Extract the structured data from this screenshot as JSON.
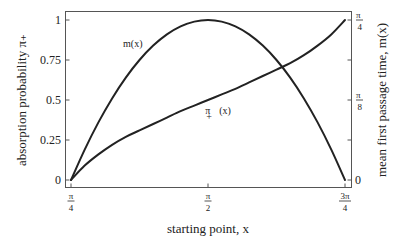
{
  "chart_data": {
    "type": "line",
    "title": "",
    "xlabel": "starting point, x",
    "ylabel": "absorption probability π₊",
    "y2label": "mean first passage time, m(x)",
    "xlim": [
      "π/4",
      "3π/4"
    ],
    "ylim": [
      0,
      1
    ],
    "y2lim": [
      "0",
      "π/4"
    ],
    "grid": false,
    "legend": "none (inline annotations)",
    "x_ticks": [
      {
        "num": "π",
        "den": "4",
        "frac": 0.0
      },
      {
        "num": "π",
        "den": "2",
        "frac": 0.5
      },
      {
        "num": "3π",
        "den": "4",
        "frac": 1.0
      }
    ],
    "y_ticks": [
      {
        "label": "0",
        "value": 0
      },
      {
        "label": "0.25",
        "value": 0.25
      },
      {
        "label": "0.5",
        "value": 0.5
      },
      {
        "label": "0.75",
        "value": 0.75
      },
      {
        "label": "1",
        "value": 1
      }
    ],
    "y2_ticks": [
      {
        "label": "0",
        "num": "",
        "den": "",
        "value": 0
      },
      {
        "label": "",
        "num": "",
        "den": "",
        "value": 0.25
      },
      {
        "label": "",
        "num": "π",
        "den": "8",
        "value": 0.5
      },
      {
        "label": "",
        "num": "",
        "den": "",
        "value": 0.75
      },
      {
        "label": "",
        "num": "π",
        "den": "4",
        "value": 1
      }
    ],
    "x_frac": [
      0,
      0.05,
      0.1,
      0.15,
      0.2,
      0.25,
      0.3,
      0.35,
      0.4,
      0.45,
      0.5,
      0.55,
      0.6,
      0.65,
      0.7,
      0.75,
      0.8,
      0.85,
      0.9,
      0.95,
      1.0
    ],
    "series": [
      {
        "name": "π₊(x)",
        "axis": "left",
        "values": [
          0,
          0.09,
          0.16,
          0.22,
          0.27,
          0.31,
          0.35,
          0.39,
          0.43,
          0.465,
          0.5,
          0.535,
          0.57,
          0.61,
          0.65,
          0.69,
          0.73,
          0.78,
          0.84,
          0.91,
          1.0
        ]
      },
      {
        "name": "m(x)",
        "axis": "right",
        "values": [
          0,
          0.19,
          0.36,
          0.51,
          0.64,
          0.75,
          0.84,
          0.91,
          0.96,
          0.99,
          1.0,
          0.99,
          0.96,
          0.91,
          0.84,
          0.75,
          0.64,
          0.51,
          0.36,
          0.19,
          0
        ]
      }
    ],
    "annotations": [
      {
        "text": "m(x)",
        "x_frac": 0.19,
        "y": 0.83
      },
      {
        "text": "π",
        "sub": "+",
        "after": "(x)",
        "x_frac": 0.49,
        "y": 0.41
      }
    ]
  }
}
